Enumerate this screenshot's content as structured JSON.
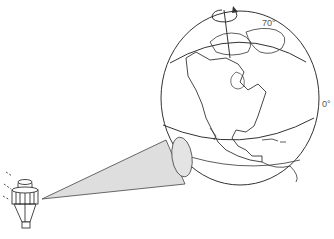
{
  "diagram": {
    "labels": {
      "lat_top": "70°",
      "lat_equator": "0°"
    },
    "elements": {
      "globe": "globe showing North America",
      "satellite": "satellite",
      "view_cone": "sensor field of view cone",
      "rotation_arrow": "Earth rotation arrow"
    },
    "colors": {
      "stroke": "#333333",
      "cone_fill": "#dedede",
      "background": "#ffffff"
    }
  }
}
